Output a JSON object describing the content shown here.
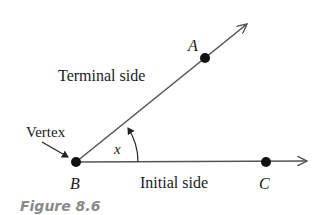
{
  "figure": {
    "caption": "Figure 8.6",
    "labels": {
      "terminal_side": "Terminal side",
      "initial_side": "Initial side",
      "vertex": "Vertex",
      "angle": "x",
      "point_a": "A",
      "point_b": "B",
      "point_c": "C"
    },
    "colors": {
      "line": "#555555",
      "point": "#111111",
      "text": "#1a1a1a",
      "caption": "#8a8a8a"
    }
  }
}
